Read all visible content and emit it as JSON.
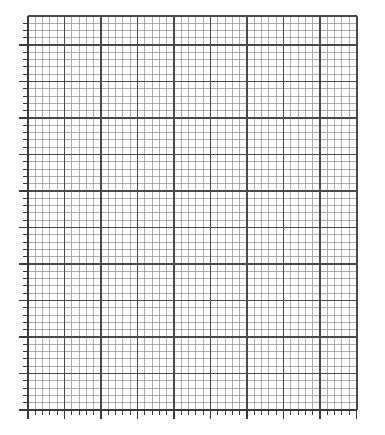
{
  "document": {
    "title": "Blank Graph Paper Grid",
    "background_color": "#ffffff",
    "width": 385,
    "height": 435
  },
  "chart_data": {
    "type": "grid",
    "title": "",
    "subtitle": "",
    "xlabel": "",
    "ylabel": "",
    "series": [],
    "values": [],
    "categories": [],
    "annotations": [],
    "legend": {
      "present": false,
      "position": "none",
      "entries": []
    },
    "grid": {
      "visible": true,
      "style": "graph-paper",
      "major_color": "#4a4a4a",
      "minor_color": "#8c8c8c",
      "major_line_width": 1.6,
      "minor_line_width": 0.7,
      "minor_per_major": 5,
      "major_columns": 9,
      "major_rows": 10,
      "partial_top_row_fraction": 0.8
    },
    "plot_area": {
      "left": 28,
      "top": 16,
      "right": 357,
      "bottom": 410,
      "width": 329,
      "height": 394,
      "major_cell_width": 36.5,
      "major_cell_height": 36.5,
      "minor_cell_width": 7.3,
      "minor_cell_height": 7.3
    },
    "axes": {
      "x_axis": {
        "position": "bottom",
        "line_color": "#3a3a3a",
        "line_width": 1.8,
        "tick_direction": "outward",
        "tick_length_major": 9,
        "tick_length_minor": 5,
        "tick_color": "#3a3a3a",
        "tick_labels": [],
        "major_tick_count": 10,
        "minor_tick_count": 46,
        "range_shown": false
      },
      "y_axis": {
        "position": "left",
        "line_color": "#3a3a3a",
        "line_width": 1.8,
        "tick_direction": "outward",
        "tick_length_major": 9,
        "tick_length_minor": 5,
        "tick_color": "#3a3a3a",
        "tick_labels": [],
        "major_tick_count": 11,
        "minor_tick_count": 54,
        "range_shown": false
      },
      "top_border": {
        "visible": true,
        "color": "#4a4a4a"
      },
      "right_border": {
        "visible": true,
        "color": "#4a4a4a"
      }
    },
    "ylim": [
      0,
      10
    ],
    "xlim": [
      0,
      9
    ]
  }
}
